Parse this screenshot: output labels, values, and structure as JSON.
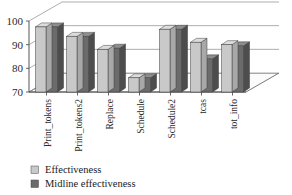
{
  "chart_data": {
    "type": "bar",
    "title": "",
    "subtitle": "",
    "xlabel": "",
    "ylabel": "",
    "ylim": [
      70,
      100
    ],
    "yticks": [
      70,
      80,
      90,
      100
    ],
    "ytick_labels": [
      "70",
      "80",
      "90",
      "100"
    ],
    "grid": true,
    "three_d": true,
    "legend_position": "bottom-left",
    "categories": [
      "Print_tokens",
      "Print_tokens2",
      "Replace",
      "Schedule",
      "Schedule2",
      "tcas",
      "tot_info"
    ],
    "series": [
      {
        "name": "Effectiveness",
        "color": "#c9c9c9",
        "values": [
          97.5,
          93.5,
          88.0,
          76.0,
          96.5,
          91.0,
          90.0
        ]
      },
      {
        "name": "Midline effectiveness",
        "color": "#6b6b6b",
        "values": [
          97.5,
          93.5,
          88.5,
          76.0,
          96.5,
          84.0,
          89.5
        ]
      }
    ]
  },
  "legend": {
    "items": [
      {
        "label": "Effectiveness",
        "color": "#c9c9c9"
      },
      {
        "label": "Midline effectiveness",
        "color": "#6b6b6b"
      }
    ]
  },
  "colors": {
    "background": "#ffffff",
    "axis": "#555555",
    "gridline": "#8a8a8a",
    "floor": "#fbfbfb",
    "wall": "#ffffff",
    "series_light": "#c9c9c9",
    "series_light_top": "#dcdcdc",
    "series_light_side": "#a8a8a8",
    "series_dark": "#6b6b6b",
    "series_dark_top": "#8e8e8e",
    "series_dark_side": "#4d4d4d"
  }
}
